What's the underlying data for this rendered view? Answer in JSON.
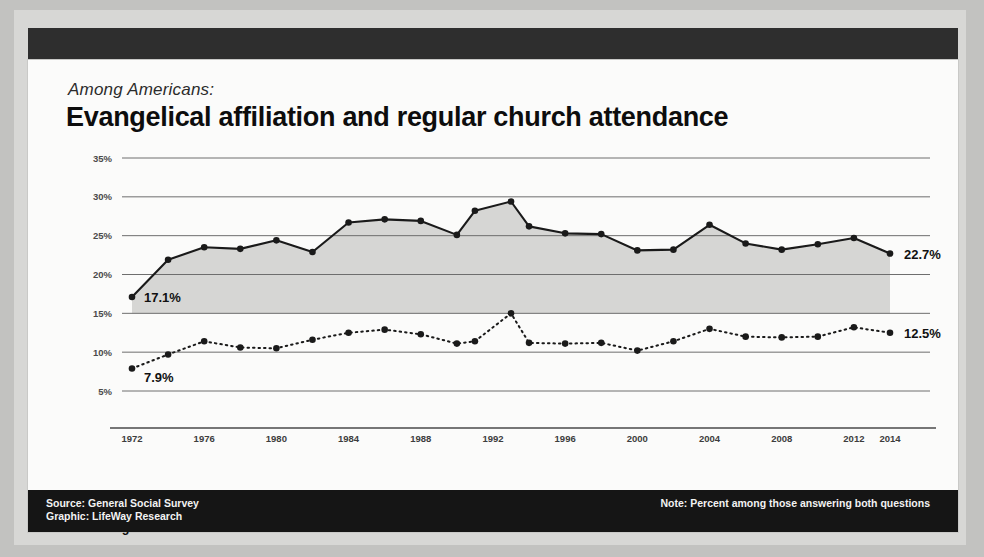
{
  "header": {
    "kicker": "Among Americans:",
    "headline": "Evangelical affiliation and regular church attendance"
  },
  "legend": {
    "items": [
      {
        "label": "Evangelical Protestants",
        "style": "solid"
      },
      {
        "label": "Regular Church Attendees",
        "style": "dotted"
      }
    ]
  },
  "footer": {
    "source": "Source: General Social Survey",
    "graphic": "Graphic: LifeWay Research",
    "note": "Note: Percent among those answering both questions"
  },
  "annotations": {
    "start_evangelical": "17.1%",
    "start_attendees": "7.9%",
    "end_evangelical": "22.7%",
    "end_attendees": "12.5%"
  },
  "chart_data": {
    "type": "line",
    "title": "Evangelical affiliation and regular church attendance",
    "subtitle": "Among Americans:",
    "xlabel": "",
    "ylabel": "",
    "ylim": [
      5,
      35
    ],
    "yticks": [
      5,
      10,
      15,
      20,
      25,
      30,
      35
    ],
    "ytick_labels": [
      "5%",
      "10%",
      "15%",
      "20%",
      "25%",
      "30%",
      "35%"
    ],
    "xlim": [
      1972,
      2014
    ],
    "xtick_labels": [
      "1972",
      "1976",
      "1980",
      "1984",
      "1988",
      "1992",
      "1996",
      "2000",
      "2004",
      "2008",
      "2012",
      "2014"
    ],
    "xticks": [
      1972,
      1976,
      1980,
      1984,
      1988,
      1992,
      1996,
      2000,
      2004,
      2008,
      2012,
      2014
    ],
    "grid": true,
    "legend_position": "below-axis-left",
    "x": [
      1972,
      1974,
      1976,
      1978,
      1980,
      1982,
      1984,
      1986,
      1988,
      1990,
      1991,
      1993,
      1994,
      1996,
      1998,
      2000,
      2002,
      2004,
      2006,
      2008,
      2010,
      2012,
      2014
    ],
    "series": [
      {
        "name": "Evangelical Protestants",
        "style": "solid",
        "fill": true,
        "values": [
          17.1,
          21.9,
          23.5,
          23.3,
          24.4,
          22.9,
          26.7,
          27.1,
          26.9,
          25.1,
          28.2,
          29.4,
          26.2,
          25.3,
          25.2,
          23.1,
          23.2,
          26.4,
          24.0,
          23.2,
          23.9,
          24.7,
          22.7
        ]
      },
      {
        "name": "Regular Church Attendees",
        "style": "dotted",
        "fill": false,
        "values": [
          7.9,
          9.7,
          11.4,
          10.6,
          10.5,
          11.6,
          12.5,
          12.9,
          12.3,
          11.1,
          11.4,
          15.0,
          11.2,
          11.1,
          11.2,
          10.2,
          11.4,
          13.0,
          12.0,
          11.9,
          12.0,
          13.2,
          12.5
        ]
      }
    ],
    "annotated_points": [
      {
        "series": "Evangelical Protestants",
        "x": 1972,
        "y": 17.1,
        "label": "17.1%"
      },
      {
        "series": "Evangelical Protestants",
        "x": 2014,
        "y": 22.7,
        "label": "22.7%"
      },
      {
        "series": "Regular Church Attendees",
        "x": 1972,
        "y": 7.9,
        "label": "7.9%"
      },
      {
        "series": "Regular Church Attendees",
        "x": 2014,
        "y": 12.5,
        "label": "12.5%"
      }
    ]
  },
  "colors": {
    "line": "#1a1a1a",
    "fill": "#d4d4d2",
    "grid": "#6e6e6e",
    "card": "#fbfbfa",
    "band": "#2e2e2e",
    "footer": "#151515"
  }
}
